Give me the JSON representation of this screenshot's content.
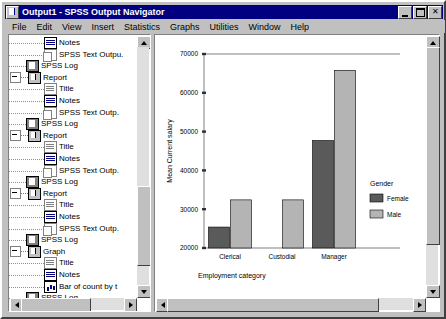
{
  "window": {
    "title": "Output1 - SPSS Output Navigator",
    "title_icon": "spss-document-icon",
    "minimize_label": "Minimize",
    "maximize_label": "Maximize",
    "close_label": "Close",
    "close_glyph": "✕"
  },
  "menu": {
    "items": [
      {
        "label": "File"
      },
      {
        "label": "Edit"
      },
      {
        "label": "View"
      },
      {
        "label": "Insert"
      },
      {
        "label": "Statistics"
      },
      {
        "label": "Graphs"
      },
      {
        "label": "Utilities"
      },
      {
        "label": "Window"
      },
      {
        "label": "Help"
      }
    ]
  },
  "outline": {
    "items": [
      {
        "label": "Notes",
        "icon": "notes-icon",
        "indent": 2,
        "expander": false
      },
      {
        "label": "SPSS Text Outpu.",
        "icon": "text-output-icon",
        "indent": 2,
        "expander": false
      },
      {
        "label": "SPSS Log",
        "icon": "log-icon",
        "indent": 1,
        "expander": false
      },
      {
        "label": "Report",
        "icon": "report-icon",
        "indent": 1,
        "expander": true
      },
      {
        "label": "Title",
        "icon": "title-icon",
        "indent": 2,
        "expander": false
      },
      {
        "label": "Notes",
        "icon": "notes-icon",
        "indent": 2,
        "expander": false
      },
      {
        "label": "SPSS Text Outp.",
        "icon": "text-output-icon",
        "indent": 2,
        "expander": false
      },
      {
        "label": "SPSS Log",
        "icon": "log-icon",
        "indent": 1,
        "expander": false
      },
      {
        "label": "Report",
        "icon": "report-icon",
        "indent": 1,
        "expander": true
      },
      {
        "label": "Title",
        "icon": "title-icon",
        "indent": 2,
        "expander": false
      },
      {
        "label": "Notes",
        "icon": "notes-icon",
        "indent": 2,
        "expander": false
      },
      {
        "label": "SPSS Text Outp.",
        "icon": "text-output-icon",
        "indent": 2,
        "expander": false
      },
      {
        "label": "SPSS Log",
        "icon": "log-icon",
        "indent": 1,
        "expander": false
      },
      {
        "label": "Report",
        "icon": "report-icon",
        "indent": 1,
        "expander": true
      },
      {
        "label": "Title",
        "icon": "title-icon",
        "indent": 2,
        "expander": false
      },
      {
        "label": "Notes",
        "icon": "notes-icon",
        "indent": 2,
        "expander": false
      },
      {
        "label": "SPSS Text Outp.",
        "icon": "text-output-icon",
        "indent": 2,
        "expander": false
      },
      {
        "label": "SPSS Log",
        "icon": "log-icon",
        "indent": 1,
        "expander": false
      },
      {
        "label": "Graph",
        "icon": "graph-icon",
        "indent": 1,
        "expander": true
      },
      {
        "label": "Title",
        "icon": "title-icon",
        "indent": 2,
        "expander": false
      },
      {
        "label": "Notes",
        "icon": "notes-icon",
        "indent": 2,
        "expander": false
      },
      {
        "label": "Bar of count by t",
        "icon": "bar-chart-icon",
        "indent": 2,
        "expander": false
      },
      {
        "label": "SPSS Log",
        "icon": "log-icon",
        "indent": 1,
        "expander": false
      },
      {
        "label": "Graph",
        "icon": "graph-icon",
        "indent": 1,
        "expander": true
      },
      {
        "label": "Title",
        "icon": "title-icon",
        "indent": 2,
        "expander": false
      },
      {
        "label": "Notes",
        "icon": "notes-icon",
        "indent": 2,
        "expander": false
      }
    ]
  },
  "chart_data": {
    "type": "bar",
    "title": "",
    "categories": [
      "Clerical",
      "Custodial",
      "Manager"
    ],
    "series": [
      {
        "name": "Female",
        "color": "#5a5a5a",
        "values": [
          25400,
          null,
          47700
        ]
      },
      {
        "name": "Male",
        "color": "#b4b4b4",
        "values": [
          32400,
          32400,
          65800
        ]
      }
    ],
    "xlabel": "Employment category",
    "ylabel": "Mean Current salary",
    "ylim": [
      20000,
      70000
    ],
    "yticks": [
      20000,
      30000,
      40000,
      50000,
      60000,
      70000
    ],
    "ytick_labels": [
      "20000",
      "30000",
      "40000",
      "50000",
      "60000",
      "70000"
    ],
    "grid": false,
    "legend": {
      "title": "Gender",
      "position": "right",
      "entries": [
        "Female",
        "Male"
      ]
    }
  },
  "scrollbars": {
    "up_arrow": "scroll-up-arrow",
    "down_arrow": "scroll-down-arrow",
    "left_arrow": "scroll-left-arrow",
    "right_arrow": "scroll-right-arrow"
  }
}
